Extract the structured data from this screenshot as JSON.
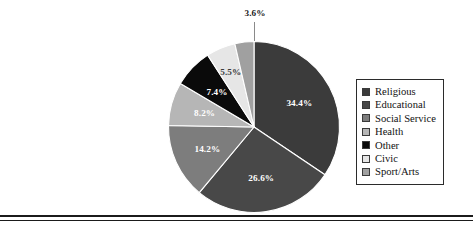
{
  "chart_data": {
    "type": "pie",
    "title": "",
    "xlabel": "",
    "ylabel": "",
    "categories": [
      "Religious",
      "Educational",
      "Social Service",
      "Health",
      "Other",
      "Civic",
      "Sport/Arts"
    ],
    "values": [
      34.4,
      26.6,
      14.2,
      8.2,
      7.4,
      5.5,
      3.6
    ],
    "value_labels": [
      "34.4%",
      "26.6%",
      "14.2%",
      "8.2%",
      "7.4%",
      "5.5%",
      "3.6%"
    ],
    "unit": "%",
    "colors": [
      "#3b3b3b",
      "#484848",
      "#7d7d7d",
      "#b6b6b6",
      "#0a0a0a",
      "#e6e6e6",
      "#a0a0a0"
    ],
    "label_colors": [
      "#ffffff",
      "#ffffff",
      "#ffffff",
      "#ffffff",
      "#ffffff",
      "#3a3a3a",
      "#1a1a1a"
    ],
    "legend_position": "right",
    "grid": false,
    "start_angle_deg": 0,
    "direction": "clockwise",
    "callout_label": "3.6%",
    "slices": [
      {
        "name": "Religious",
        "value": 34.4,
        "label": "34.4%",
        "color": "#3b3b3b",
        "label_color": "#ffffff"
      },
      {
        "name": "Educational",
        "value": 26.6,
        "label": "26.6%",
        "color": "#484848",
        "label_color": "#ffffff"
      },
      {
        "name": "Social Service",
        "value": 14.2,
        "label": "14.2%",
        "color": "#7d7d7d",
        "label_color": "#ffffff"
      },
      {
        "name": "Health",
        "value": 8.2,
        "label": "8.2%",
        "color": "#b6b6b6",
        "label_color": "#ffffff"
      },
      {
        "name": "Other",
        "value": 7.4,
        "label": "7.4%",
        "color": "#0a0a0a",
        "label_color": "#ffffff"
      },
      {
        "name": "Civic",
        "value": 5.5,
        "label": "5.5%",
        "color": "#e6e6e6",
        "label_color": "#3a3a3a"
      },
      {
        "name": "Sport/Arts",
        "value": 3.6,
        "label": "3.6%",
        "color": "#a0a0a0",
        "label_color": "#1a1a1a"
      }
    ]
  },
  "legend": {
    "items": [
      {
        "label": "Religious",
        "color": "#3b3b3b"
      },
      {
        "label": "Educational",
        "color": "#484848"
      },
      {
        "label": "Social Service",
        "color": "#7d7d7d"
      },
      {
        "label": "Health",
        "color": "#b6b6b6"
      },
      {
        "label": "Other",
        "color": "#0a0a0a"
      },
      {
        "label": "Civic",
        "color": "#e6e6e6"
      },
      {
        "label": "Sport/Arts",
        "color": "#a0a0a0"
      }
    ]
  }
}
